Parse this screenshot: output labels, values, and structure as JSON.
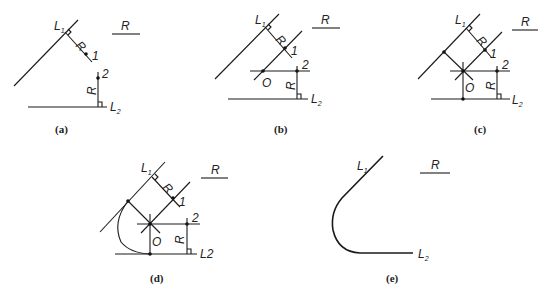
{
  "figure": {
    "panels": [
      {
        "id": "a",
        "caption": "(a)",
        "labels": {
          "L1": "L",
          "L1_sub": "1",
          "L2": "L",
          "L2_sub": "2",
          "R_ref": "R",
          "R_perp": "R",
          "R_vert": "R",
          "p1": "1",
          "p2": "2"
        }
      },
      {
        "id": "b",
        "caption": "(b)",
        "labels": {
          "L1": "L",
          "L1_sub": "1",
          "L2": "L",
          "L2_sub": "2",
          "R_ref": "R",
          "R_perp": "R",
          "R_vert": "R",
          "p1": "1",
          "p2": "2",
          "O": "O"
        }
      },
      {
        "id": "c",
        "caption": "(c)",
        "labels": {
          "L1": "L",
          "L1_sub": "1",
          "L2": "L",
          "L2_sub": "2",
          "R_ref": "R",
          "R_perp": "R",
          "R_vert": "R",
          "p1": "1",
          "p2": "2",
          "O": "O"
        }
      },
      {
        "id": "d",
        "caption": "(d)",
        "labels": {
          "L1": "L",
          "L1_sub": "1",
          "L2": "L2",
          "R_ref": "R",
          "R_perp": "R",
          "R_vert": "R",
          "p1": "1",
          "p2": "2",
          "O": "O"
        }
      },
      {
        "id": "e",
        "caption": "(e)",
        "labels": {
          "L1": "L",
          "L1_sub": "1",
          "L2": "L",
          "L2_sub": "2",
          "R_ref": "R"
        }
      }
    ]
  }
}
